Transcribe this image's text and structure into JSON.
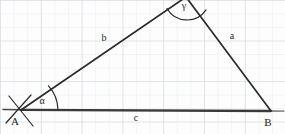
{
  "figure": {
    "kind": "geometry-diagram",
    "background": "graph-paper",
    "width": 285,
    "height": 134
  },
  "colors": {
    "paper": "#fdfdfd",
    "grid_minor": "#e9ecef",
    "grid_major": "#d0d4d8",
    "ink": "#2a2a2a",
    "ink_strong": "#3a3a3a",
    "label_ink": "#1d1d1d"
  },
  "vertices": [
    {
      "id": "A",
      "label": "A",
      "x": 21,
      "y": 110,
      "label_x": 15,
      "label_y": 125
    },
    {
      "id": "B",
      "label": "B",
      "x": 271,
      "y": 111,
      "label_x": 266,
      "label_y": 126
    },
    {
      "id": "C",
      "label": "",
      "x": 186,
      "y": -3,
      "label_x": 0,
      "label_y": 0
    }
  ],
  "sides": [
    {
      "id": "a",
      "label": "a",
      "from": "B",
      "to": "C",
      "label_x": 232,
      "label_y": 39
    },
    {
      "id": "b",
      "label": "b",
      "from": "A",
      "to": "C",
      "label_x": 104,
      "label_y": 41
    },
    {
      "id": "c",
      "label": "c",
      "from": "A",
      "to": "B",
      "label_x": 136,
      "label_y": 121
    }
  ],
  "angles": [
    {
      "id": "alpha",
      "label": "α",
      "at_vertex": "A",
      "label_x": 42,
      "label_y": 104
    },
    {
      "id": "gamma",
      "label": "γ",
      "at_vertex": "C",
      "label_x": 184,
      "label_y": 9
    }
  ],
  "marks": {
    "vertex_a_cross": "two short crossing tick strokes through vertex A",
    "base_extension": "baseline extends slightly beyond A on the left and beyond B on the right"
  }
}
